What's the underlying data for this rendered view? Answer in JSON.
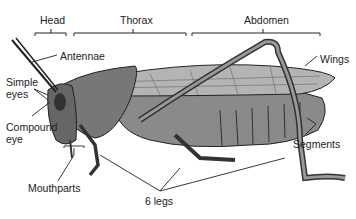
{
  "diagram": {
    "regions": [
      {
        "label": "Head"
      },
      {
        "label": "Thorax"
      },
      {
        "label": "Abdomen"
      }
    ],
    "labels": {
      "antennae": "Antennae",
      "simple_eyes_1": "Simple",
      "simple_eyes_2": "eyes",
      "compound_eye_1": "Compound",
      "compound_eye_2": "eye",
      "mouthparts": "Mouthparts",
      "legs": "6 legs",
      "wings": "Wings",
      "segments": "Segments"
    }
  }
}
